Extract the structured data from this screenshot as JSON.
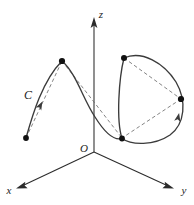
{
  "figure": {
    "width": 194,
    "height": 205,
    "background_color": "#ffffff",
    "curve_color": "#3b3b3b",
    "chord_color": "#6e6e6e",
    "axis_color": "#2b2b2b",
    "node_color": "#111111"
  },
  "axes": {
    "origin_label": "O",
    "z_label": "z",
    "x_label": "x",
    "y_label": "y",
    "origin": {
      "x": 94,
      "y": 152
    },
    "z_tip": {
      "x": 94,
      "y": 18
    },
    "x_tip": {
      "x": 16,
      "y": 186
    },
    "y_tip": {
      "x": 174,
      "y": 186
    }
  },
  "curve": {
    "label": "C",
    "label_position": {
      "x": 28,
      "y": 99
    },
    "stroke_width": 1.35,
    "path": "M 26,138 C 33,116 43,80 62,61 C 77,74 83,100 95,117 C 106,133 114,140 122,138 C 128,128 122,80 124,58 C 140,50 163,62 175,80 C 186,98 186,122 172,134 C 156,146 132,146 122,138"
  },
  "chords": {
    "description": "dashed straight-line segments joining successive partition points",
    "stroke_width": 0.85,
    "dash_pattern": "3.6 2.6",
    "segments": [
      {
        "from": {
          "x": 26,
          "y": 138
        },
        "to": {
          "x": 62,
          "y": 61
        }
      },
      {
        "from": {
          "x": 62,
          "y": 61
        },
        "to": {
          "x": 122,
          "y": 138
        }
      },
      {
        "from": {
          "x": 124,
          "y": 58
        },
        "to": {
          "x": 181,
          "y": 99
        }
      },
      {
        "from": {
          "x": 181,
          "y": 99
        },
        "to": {
          "x": 122,
          "y": 138
        }
      }
    ]
  },
  "nodes": [
    {
      "name": "partition-point-0",
      "x": 26,
      "y": 138,
      "radius": 2.9
    },
    {
      "name": "partition-point-1",
      "x": 62,
      "y": 61,
      "radius": 3.1
    },
    {
      "name": "partition-point-2",
      "x": 122,
      "y": 138,
      "radius": 2.9
    },
    {
      "name": "partition-point-3",
      "x": 124,
      "y": 58,
      "radius": 3.0
    },
    {
      "name": "partition-point-4",
      "x": 181,
      "y": 99,
      "radius": 3.1
    }
  ],
  "direction_arrows": [
    {
      "name": "direction-arrow-left",
      "x": 40,
      "y": 106,
      "angle": -62
    },
    {
      "name": "direction-arrow-right",
      "x": 178,
      "y": 119,
      "angle": -78
    }
  ]
}
